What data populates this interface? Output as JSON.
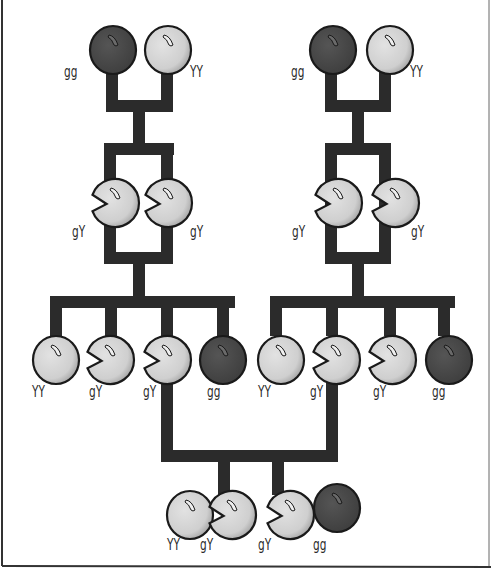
{
  "diagram": {
    "type": "pedigree",
    "colors": {
      "background": "#ffffff",
      "line": "#2b2b2b",
      "green_pea": "#4a4a4a",
      "yellow_pea": "#d6d6d6",
      "outline": "#1a1a1a",
      "border": "#333333"
    },
    "generations": {
      "parents_left": [
        {
          "id": "pl1",
          "genotype": "gg",
          "shape": "round",
          "color": "green"
        },
        {
          "id": "pl2",
          "genotype": "YY",
          "shape": "round",
          "color": "yellow"
        }
      ],
      "parents_right": [
        {
          "id": "pr1",
          "genotype": "gg",
          "shape": "round",
          "color": "green"
        },
        {
          "id": "pr2",
          "genotype": "YY",
          "shape": "round",
          "color": "yellow"
        }
      ],
      "f1_left": [
        {
          "id": "f1l1",
          "genotype": "gY",
          "shape": "notched",
          "color": "yellow"
        },
        {
          "id": "f1l2",
          "genotype": "gY",
          "shape": "notched",
          "color": "yellow"
        }
      ],
      "f1_right": [
        {
          "id": "f1r1",
          "genotype": "gY",
          "shape": "notched",
          "color": "yellow"
        },
        {
          "id": "f1r2",
          "genotype": "gY",
          "shape": "notched",
          "color": "yellow"
        }
      ],
      "f2_left": [
        {
          "id": "f2l1",
          "genotype": "YY",
          "shape": "round",
          "color": "yellow"
        },
        {
          "id": "f2l2",
          "genotype": "gY",
          "shape": "notched",
          "color": "yellow"
        },
        {
          "id": "f2l3",
          "genotype": "gY",
          "shape": "notched",
          "color": "yellow"
        },
        {
          "id": "f2l4",
          "genotype": "gg",
          "shape": "round",
          "color": "green"
        }
      ],
      "f2_right": [
        {
          "id": "f2r1",
          "genotype": "YY",
          "shape": "round",
          "color": "yellow"
        },
        {
          "id": "f2r2",
          "genotype": "gY",
          "shape": "notched",
          "color": "yellow"
        },
        {
          "id": "f2r3",
          "genotype": "gY",
          "shape": "notched",
          "color": "yellow"
        },
        {
          "id": "f2r4",
          "genotype": "gg",
          "shape": "round",
          "color": "green"
        }
      ],
      "f3": [
        {
          "id": "f31",
          "genotype": "YY",
          "shape": "round",
          "color": "yellow"
        },
        {
          "id": "f32",
          "genotype": "gY",
          "shape": "notched",
          "color": "yellow"
        },
        {
          "id": "f33",
          "genotype": "gY",
          "shape": "notched",
          "color": "yellow"
        },
        {
          "id": "f34",
          "genotype": "gg",
          "shape": "round",
          "color": "green"
        }
      ]
    }
  }
}
